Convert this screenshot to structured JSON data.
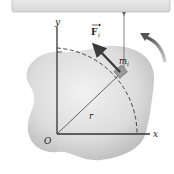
{
  "diagram": {
    "type": "rigid-body-rotation",
    "labels": {
      "force": "F",
      "force_subscript": "i",
      "mass": "m",
      "mass_subscript": "i",
      "radius": "r",
      "origin": "O",
      "x_axis": "x",
      "y_axis": "y"
    },
    "colors": {
      "body_light": "#e9e9e9",
      "body_dark": "#b8b8b8",
      "axis": "#333333",
      "arrow": "#3a3a3a",
      "mass_block": "#9a9a9a",
      "top_panel": "#e4e4e4",
      "top_panel_border": "#bdbdbd",
      "rotation_arrow": "#777777"
    }
  }
}
